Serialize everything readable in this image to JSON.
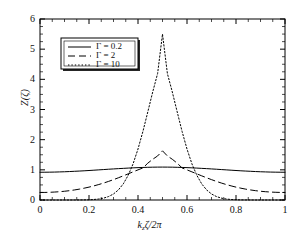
{
  "figure": {
    "axis_label_x": "k",
    "axis_label_x_sub": "z",
    "axis_label_x_rest": "ζ/2π",
    "axis_label_y": "Z(ζ)"
  },
  "chart_data": {
    "type": "line",
    "title": "",
    "xlabel": "k_z ζ / 2π",
    "ylabel": "Z(ζ)",
    "xlim": [
      0,
      1
    ],
    "ylim": [
      0,
      6
    ],
    "xticks": [
      "0",
      "0.2",
      "0.4",
      "0.6",
      "0.8",
      "1"
    ],
    "xtick_values": [
      0,
      0.2,
      0.4,
      0.6,
      0.8,
      1
    ],
    "yticks": [
      "0",
      "1",
      "2",
      "3",
      "4",
      "5",
      "6"
    ],
    "ytick_values": [
      0,
      1,
      2,
      3,
      4,
      5,
      6
    ],
    "minor_ticks": true,
    "grid": false,
    "legend_position": "upper-left",
    "x": [
      0,
      0.02,
      0.04,
      0.06,
      0.08,
      0.1,
      0.12,
      0.14,
      0.16,
      0.18,
      0.2,
      0.22,
      0.24,
      0.26,
      0.28,
      0.3,
      0.32,
      0.34,
      0.36,
      0.38,
      0.4,
      0.42,
      0.44,
      0.46,
      0.48,
      0.5,
      0.52,
      0.54,
      0.56,
      0.58,
      0.6,
      0.62,
      0.64,
      0.66,
      0.68,
      0.7,
      0.72,
      0.74,
      0.76,
      0.78,
      0.8,
      0.82,
      0.84,
      0.86,
      0.88,
      0.9,
      0.92,
      0.94,
      0.96,
      0.98,
      1
    ],
    "series": [
      {
        "name": "Γ = 0.2",
        "label": "Γ = 0.2",
        "gamma": 0.2,
        "style": "solid",
        "color": "#000000",
        "values": [
          0.92,
          0.921,
          0.923,
          0.926,
          0.931,
          0.936,
          0.943,
          0.951,
          0.959,
          0.968,
          0.978,
          0.988,
          0.999,
          1.009,
          1.02,
          1.03,
          1.04,
          1.049,
          1.058,
          1.066,
          1.073,
          1.079,
          1.084,
          1.088,
          1.09,
          1.091,
          1.09,
          1.088,
          1.084,
          1.079,
          1.073,
          1.066,
          1.058,
          1.049,
          1.04,
          1.03,
          1.02,
          1.009,
          0.999,
          0.988,
          0.978,
          0.968,
          0.959,
          0.951,
          0.943,
          0.936,
          0.931,
          0.926,
          0.923,
          0.921,
          0.92
        ]
      },
      {
        "name": "Γ = 2",
        "label": "Γ = 2",
        "gamma": 2,
        "style": "dashed",
        "color": "#000000",
        "values": [
          0.25,
          0.251,
          0.256,
          0.264,
          0.275,
          0.29,
          0.309,
          0.332,
          0.359,
          0.391,
          0.427,
          0.468,
          0.513,
          0.563,
          0.617,
          0.675,
          0.737,
          0.801,
          0.867,
          0.933,
          0.999,
          1.062,
          1.221,
          1.35,
          1.46,
          1.63,
          1.46,
          1.35,
          1.221,
          1.062,
          0.999,
          0.933,
          0.867,
          0.801,
          0.737,
          0.675,
          0.617,
          0.563,
          0.513,
          0.468,
          0.427,
          0.391,
          0.359,
          0.332,
          0.309,
          0.29,
          0.275,
          0.264,
          0.256,
          0.251,
          0.25
        ]
      },
      {
        "name": "Γ = 10",
        "label": "Γ = 10",
        "gamma": 10,
        "style": "dotted",
        "color": "#000000",
        "values": [
          0.0,
          0.0,
          0.0,
          0.0,
          0.0,
          0.0,
          0.0,
          0.001,
          0.002,
          0.004,
          0.008,
          0.017,
          0.033,
          0.063,
          0.115,
          0.2,
          0.334,
          0.535,
          0.82,
          1.2,
          1.69,
          2.27,
          2.92,
          3.58,
          4.19,
          5.5,
          4.19,
          3.58,
          2.92,
          2.27,
          1.69,
          1.2,
          0.82,
          0.535,
          0.334,
          0.2,
          0.115,
          0.063,
          0.033,
          0.017,
          0.008,
          0.004,
          0.002,
          0.001,
          0.0,
          0.0,
          0.0,
          0.0,
          0.0,
          0.0,
          0.0
        ]
      }
    ]
  }
}
